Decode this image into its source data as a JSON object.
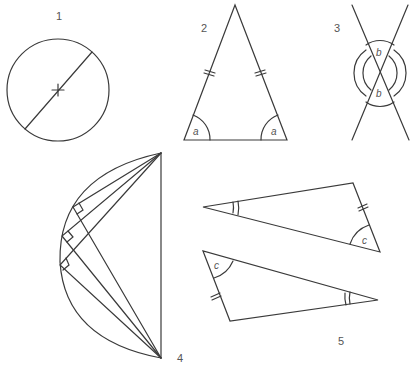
{
  "figures": [
    {
      "id": "1",
      "label": "1",
      "kind": "circle with diameter and centre mark"
    },
    {
      "id": "2",
      "label": "2",
      "kind": "isosceles triangle",
      "angle_label": "a",
      "angle_label_2": "a"
    },
    {
      "id": "3",
      "label": "3",
      "kind": "vertically opposite angles",
      "angle_label": "b",
      "angle_label_2": "b"
    },
    {
      "id": "4",
      "label": "4",
      "kind": "angles in a semicircle"
    },
    {
      "id": "5",
      "label": "5",
      "kind": "congruent triangles",
      "angle_label": "c",
      "angle_label_2": "c"
    }
  ],
  "colors": {
    "line": "#3a3a3a",
    "text": "#555555",
    "background": "#ffffff"
  }
}
